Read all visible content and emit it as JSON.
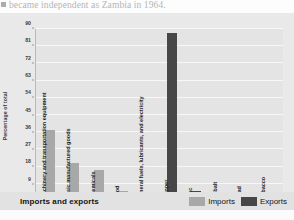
{
  "bleed_text": "became independent as Zambia in 1964.",
  "figure": {
    "footer_title": "Imports and exports",
    "legend": {
      "position": "bottom-right",
      "items": [
        {
          "label": "Imports",
          "color": "#a8a8a8",
          "key": "imports"
        },
        {
          "label": "Exports",
          "color": "#474747",
          "key": "exports"
        }
      ]
    }
  },
  "chart_data": {
    "type": "bar",
    "title": "Imports and exports",
    "xlabel": "",
    "ylabel": "Percentage of total",
    "ylim": [
      0,
      90
    ],
    "grid": true,
    "yticks": [
      0,
      9,
      18,
      27,
      36,
      45,
      54,
      63,
      72,
      81,
      90
    ],
    "ytick_labels": [
      "0",
      "9",
      "18",
      "27",
      "36",
      "45",
      "54",
      "63",
      "72",
      "81",
      "90"
    ],
    "legend_position": "bottom-right",
    "categories": [
      "Machinery and transportation equipment",
      "Basic manufactured goods",
      "Chemicals",
      "Food",
      "Mineral fuels, lubricants, and electricity",
      "Copper",
      "Zinc",
      "Cobalt",
      "Lead",
      "Tobacco"
    ],
    "series": [
      {
        "name": "Imports",
        "color": "#a8a8a8",
        "values": [
          37,
          20,
          16,
          5,
          4,
          null,
          null,
          null,
          null,
          null
        ]
      },
      {
        "name": "Exports",
        "color": "#474747",
        "values": [
          null,
          null,
          null,
          null,
          null,
          88,
          5,
          2,
          1,
          null
        ]
      }
    ],
    "points": [
      {
        "category": "Machinery and transportation equipment",
        "series": "Imports",
        "value": 37
      },
      {
        "category": "Basic manufactured goods",
        "series": "Imports",
        "value": 20
      },
      {
        "category": "Chemicals",
        "series": "Imports",
        "value": 16
      },
      {
        "category": "Food",
        "series": "Imports",
        "value": 5
      },
      {
        "category": "Mineral fuels, lubricants, and electricity",
        "series": "Imports",
        "value": 4
      },
      {
        "category": "Copper",
        "series": "Exports",
        "value": 88
      },
      {
        "category": "Zinc",
        "series": "Exports",
        "value": 5
      },
      {
        "category": "Cobalt",
        "series": "Exports",
        "value": 2
      },
      {
        "category": "Lead",
        "series": "Exports",
        "value": 1
      },
      {
        "category": "Tobacco",
        "series": "Exports",
        "value": 0.6
      }
    ]
  }
}
